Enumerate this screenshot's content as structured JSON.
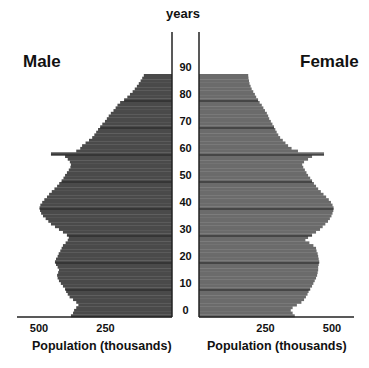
{
  "chart_data": {
    "type": "bar",
    "subtype": "population-pyramid",
    "title": "",
    "center_axis_label": "years",
    "left_title": "Male",
    "right_title": "Female",
    "xlabel_left": "Population (thousands)",
    "xlabel_right": "Population (thousands)",
    "x_ticks": [
      250,
      500
    ],
    "x_tick_labels": [
      "250",
      "500"
    ],
    "y_ticks": [
      0,
      10,
      20,
      30,
      40,
      50,
      60,
      70,
      80,
      90
    ],
    "y_tick_labels": [
      "0",
      "10",
      "20",
      "30",
      "40",
      "50",
      "60",
      "70",
      "80",
      "90"
    ],
    "xlim": [
      0,
      530
    ],
    "ylim": [
      0,
      90
    ],
    "grid": "horizontal lines at each decade",
    "colors": {
      "male": "#4a4a4a",
      "female": "#6b6b6b",
      "grid": "#222222"
    },
    "series": [
      {
        "name": "Male",
        "ages": [
          0,
          1,
          2,
          3,
          4,
          5,
          6,
          7,
          8,
          9,
          10,
          11,
          12,
          13,
          14,
          15,
          16,
          17,
          18,
          19,
          20,
          21,
          22,
          23,
          24,
          25,
          26,
          27,
          28,
          29,
          30,
          31,
          32,
          33,
          34,
          35,
          36,
          37,
          38,
          39,
          40,
          41,
          42,
          43,
          44,
          45,
          46,
          47,
          48,
          49,
          50,
          51,
          52,
          53,
          54,
          55,
          56,
          57,
          58,
          59,
          60,
          61,
          62,
          63,
          64,
          65,
          66,
          67,
          68,
          69,
          70,
          71,
          72,
          73,
          74,
          75,
          76,
          77,
          78,
          79,
          80,
          81,
          82,
          83,
          84,
          85,
          86,
          87,
          88,
          89
        ],
        "values": [
          380,
          372,
          368,
          360,
          352,
          360,
          372,
          385,
          392,
          398,
          402,
          410,
          418,
          425,
          430,
          432,
          428,
          425,
          430,
          436,
          440,
          436,
          430,
          426,
          420,
          415,
          410,
          400,
          392,
          388,
          395,
          410,
          425,
          440,
          455,
          465,
          475,
          485,
          492,
          496,
          498,
          495,
          488,
          480,
          470,
          462,
          452,
          442,
          432,
          424,
          415,
          408,
          402,
          395,
          388,
          382,
          380,
          384,
          392,
          402,
          455,
          360,
          345,
          338,
          325,
          312,
          300,
          292,
          285,
          278,
          270,
          262,
          252,
          245,
          238,
          230,
          220,
          212,
          205,
          195,
          180,
          168,
          158,
          148,
          140,
          132,
          125,
          118,
          112,
          106
        ]
      },
      {
        "name": "Female",
        "ages": [
          0,
          1,
          2,
          3,
          4,
          5,
          6,
          7,
          8,
          9,
          10,
          11,
          12,
          13,
          14,
          15,
          16,
          17,
          18,
          19,
          20,
          21,
          22,
          23,
          24,
          25,
          26,
          27,
          28,
          29,
          30,
          31,
          32,
          33,
          34,
          35,
          36,
          37,
          38,
          39,
          40,
          41,
          42,
          43,
          44,
          45,
          46,
          47,
          48,
          49,
          50,
          51,
          52,
          53,
          54,
          55,
          56,
          57,
          58,
          59,
          60,
          61,
          62,
          63,
          64,
          65,
          66,
          67,
          68,
          69,
          70,
          71,
          72,
          73,
          74,
          75,
          76,
          77,
          78,
          79,
          80,
          81,
          82,
          83,
          84,
          85,
          86,
          87,
          88,
          89
        ],
        "values": [
          360,
          352,
          345,
          352,
          368,
          385,
          395,
          402,
          408,
          412,
          418,
          425,
          430,
          435,
          440,
          444,
          446,
          448,
          448,
          450,
          452,
          450,
          448,
          446,
          442,
          440,
          430,
          415,
          400,
          410,
          425,
          440,
          455,
          465,
          475,
          485,
          492,
          498,
          502,
          505,
          506,
          502,
          496,
          488,
          478,
          468,
          458,
          448,
          440,
          432,
          425,
          418,
          410,
          404,
          398,
          392,
          388,
          395,
          410,
          425,
          470,
          372,
          348,
          335,
          325,
          315,
          305,
          298,
          292,
          287,
          282,
          276,
          270,
          264,
          260,
          255,
          248,
          242,
          236,
          228,
          222,
          215,
          210,
          204,
          198,
          194,
          190,
          188,
          186,
          185
        ]
      }
    ]
  }
}
